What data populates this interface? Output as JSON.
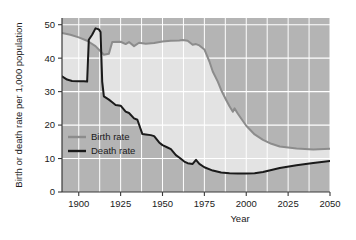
{
  "chart_data": {
    "type": "line",
    "title": "",
    "xlabel": "Year",
    "ylabel": "Birth or death rate per 1,000 population",
    "xlim": [
      1890,
      2050
    ],
    "ylim": [
      0,
      52
    ],
    "xticks": [
      1900,
      1925,
      1950,
      1975,
      2000,
      2025,
      2050
    ],
    "xtick_labels": [
      "1900",
      "1925",
      "1950",
      "1975",
      "2000",
      "2025",
      "2050"
    ],
    "yticks": [
      0,
      10,
      20,
      30,
      40,
      50
    ],
    "ytick_labels": [
      "0",
      "10",
      "20",
      "30",
      "40",
      "50"
    ],
    "grid": true,
    "legend_position": "middle-left",
    "series": [
      {
        "name": "Birth rate",
        "color": "#8c8c8c",
        "points": [
          [
            1890,
            47.5
          ],
          [
            1895,
            47.0
          ],
          [
            1900,
            46.2
          ],
          [
            1905,
            45.2
          ],
          [
            1910,
            43.6
          ],
          [
            1915,
            41.0
          ],
          [
            1918,
            41.3
          ],
          [
            1920,
            44.8
          ],
          [
            1925,
            44.9
          ],
          [
            1928,
            44.2
          ],
          [
            1930,
            44.8
          ],
          [
            1933,
            43.6
          ],
          [
            1936,
            44.6
          ],
          [
            1940,
            44.3
          ],
          [
            1945,
            44.5
          ],
          [
            1950,
            45.0
          ],
          [
            1955,
            45.2
          ],
          [
            1960,
            45.3
          ],
          [
            1962,
            45.4
          ],
          [
            1965,
            45.2
          ],
          [
            1968,
            44.0
          ],
          [
            1970,
            44.2
          ],
          [
            1972,
            43.8
          ],
          [
            1975,
            42.6
          ],
          [
            1978,
            39.0
          ],
          [
            1980,
            36.0
          ],
          [
            1983,
            33.0
          ],
          [
            1985,
            30.5
          ],
          [
            1988,
            27.5
          ],
          [
            1990,
            25.6
          ],
          [
            1992,
            24.0
          ],
          [
            1993,
            25.0
          ],
          [
            1995,
            23.4
          ],
          [
            1998,
            21.2
          ],
          [
            2000,
            19.8
          ],
          [
            2005,
            17.2
          ],
          [
            2010,
            15.6
          ],
          [
            2015,
            14.4
          ],
          [
            2020,
            13.6
          ],
          [
            2030,
            13.0
          ],
          [
            2040,
            12.7
          ],
          [
            2050,
            12.9
          ]
        ]
      },
      {
        "name": "Death rate",
        "color": "#1a1a1a",
        "points": [
          [
            1890,
            34.6
          ],
          [
            1893,
            33.6
          ],
          [
            1896,
            33.2
          ],
          [
            1900,
            33.1
          ],
          [
            1903,
            33.1
          ],
          [
            1905,
            33.0
          ],
          [
            1906,
            45.5
          ],
          [
            1908,
            47.0
          ],
          [
            1910,
            48.9
          ],
          [
            1912,
            48.6
          ],
          [
            1913,
            47.8
          ],
          [
            1914,
            33.0
          ],
          [
            1915,
            28.6
          ],
          [
            1918,
            27.6
          ],
          [
            1920,
            26.8
          ],
          [
            1922,
            26.0
          ],
          [
            1925,
            25.8
          ],
          [
            1928,
            24.0
          ],
          [
            1930,
            23.6
          ],
          [
            1933,
            22.0
          ],
          [
            1935,
            21.6
          ],
          [
            1938,
            17.3
          ],
          [
            1940,
            17.2
          ],
          [
            1943,
            17.0
          ],
          [
            1945,
            16.7
          ],
          [
            1948,
            14.8
          ],
          [
            1950,
            14.0
          ],
          [
            1953,
            13.3
          ],
          [
            1955,
            12.8
          ],
          [
            1958,
            11.0
          ],
          [
            1960,
            10.3
          ],
          [
            1963,
            9.1
          ],
          [
            1965,
            8.6
          ],
          [
            1968,
            8.4
          ],
          [
            1970,
            9.6
          ],
          [
            1972,
            8.4
          ],
          [
            1975,
            7.4
          ],
          [
            1980,
            6.4
          ],
          [
            1985,
            5.8
          ],
          [
            1990,
            5.6
          ],
          [
            1995,
            5.5
          ],
          [
            2000,
            5.5
          ],
          [
            2005,
            5.6
          ],
          [
            2010,
            6.0
          ],
          [
            2015,
            6.6
          ],
          [
            2020,
            7.2
          ],
          [
            2030,
            8.0
          ],
          [
            2040,
            8.7
          ],
          [
            2050,
            9.3
          ]
        ]
      }
    ],
    "legend": [
      {
        "label": "Birth rate",
        "color": "#8c8c8c"
      },
      {
        "label": "Death rate",
        "color": "#1a1a1a"
      }
    ],
    "colors": {
      "plot_background": "#b4b4b4",
      "gap_fill": "#e3e3e3",
      "gridline": "#ffffff",
      "axis": "#3a3a3a",
      "page_background": "#ffffff"
    }
  }
}
